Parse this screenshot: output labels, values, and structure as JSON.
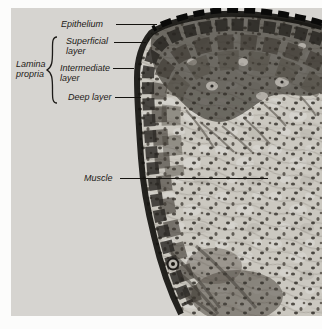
{
  "colors": {
    "page_bg": "#fcfcfb",
    "photo_bg": "#d6d4d0",
    "tissue_base": "#cbc8c0",
    "label_text": "#1c1a17",
    "leader_line": "#15130f"
  },
  "annotations": {
    "epithelium": {
      "label": "Epithelium"
    },
    "superficial_layer": {
      "line1": "Superficial",
      "line2": "layer"
    },
    "intermediate_layer": {
      "line1": "Intermediate",
      "line2": "layer"
    },
    "deep_layer": {
      "label": "Deep layer"
    },
    "lamina_propria": {
      "line1": "Lamina",
      "line2": "propria"
    },
    "muscle": {
      "label": "Muscle"
    }
  }
}
